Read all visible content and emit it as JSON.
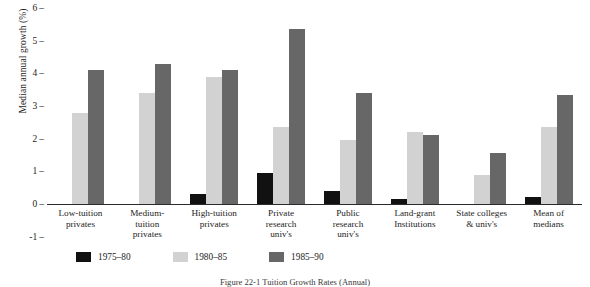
{
  "chart_data": {
    "type": "bar",
    "title": "",
    "xlabel": "",
    "ylabel": "Median annual growth (%)",
    "ylim": [
      -1,
      6
    ],
    "yticks": [
      6,
      5,
      4,
      3,
      2,
      1,
      0,
      -1
    ],
    "grid": false,
    "legend_position": "bottom-left",
    "categories": [
      "Low-tuition privates",
      "Medium-tuition privates",
      "High-tuition privates",
      "Private research univ's",
      "Public research univ's",
      "Land-grant Institutions",
      "State colleges & univ's",
      "Mean of medians"
    ],
    "category_lines": [
      [
        "Low-tuition",
        "privates"
      ],
      [
        "Medium-",
        "tuition",
        "privates"
      ],
      [
        "High-tuition",
        "privates"
      ],
      [
        "Private",
        "research",
        "univ's"
      ],
      [
        "Public",
        "research",
        "univ's"
      ],
      [
        "Land-grant",
        "Institutions"
      ],
      [
        "State colleges",
        "& univ's"
      ],
      [
        "Mean of",
        "medians"
      ]
    ],
    "series": [
      {
        "name": "1975–80",
        "color": "#111111",
        "values": [
          0,
          0,
          0.3,
          0.95,
          0.4,
          0.15,
          0,
          0.2
        ]
      },
      {
        "name": "1980–85",
        "color": "#d2d2d2",
        "values": [
          2.8,
          3.4,
          3.9,
          2.35,
          1.95,
          2.2,
          0.9,
          2.35
        ]
      },
      {
        "name": "1985–90",
        "color": "#676767",
        "values": [
          4.1,
          4.3,
          4.1,
          5.35,
          3.4,
          2.1,
          1.55,
          3.35
        ]
      }
    ]
  },
  "legend": {
    "items": [
      {
        "label": "1975–80",
        "color": "#111111"
      },
      {
        "label": "1980–85",
        "color": "#d2d2d2"
      },
      {
        "label": "1985–90",
        "color": "#676767"
      }
    ]
  },
  "caption": "Figure 22-1  Tuition Growth Rates (Annual)"
}
